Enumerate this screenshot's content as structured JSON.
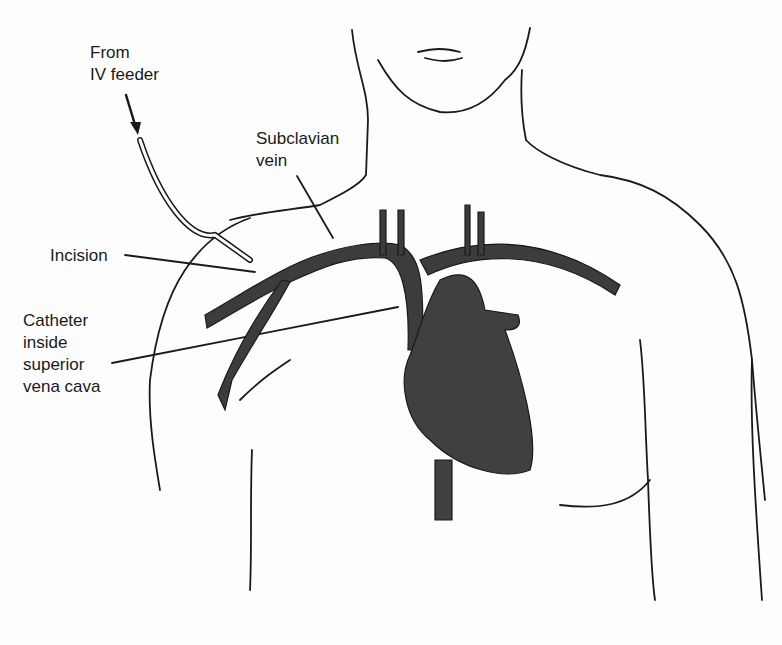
{
  "diagram": {
    "labels": {
      "iv_feeder": "From\nIV feeder",
      "subclavian": "Subclavian\nvein",
      "incision": "Incision",
      "catheter": "Catheter\ninside\nsuperior\nvena cava"
    },
    "colors": {
      "ink": "#1a1a1a",
      "vessel_fill": "#3c3c3c",
      "heart_fill": "#404040",
      "background": "#fdfdfd"
    }
  }
}
